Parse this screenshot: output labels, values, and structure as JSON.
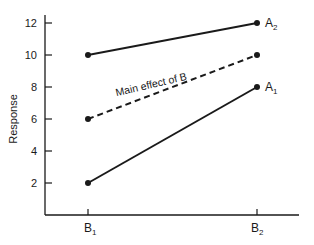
{
  "chart_data": {
    "type": "line",
    "title": "",
    "xlabel": "",
    "ylabel": "Response",
    "categories": [
      "B1",
      "B2"
    ],
    "category_labels": [
      {
        "base": "B",
        "sub": "1"
      },
      {
        "base": "B",
        "sub": "2"
      }
    ],
    "yticks": [
      2,
      4,
      6,
      8,
      10,
      12
    ],
    "ylim": [
      0,
      12.5
    ],
    "grid": false,
    "legend": "none (direct line labels)",
    "series": [
      {
        "name": "A2",
        "label_base": "A",
        "label_sub": "2",
        "values": [
          10,
          12
        ],
        "style": "solid"
      },
      {
        "name": "Main effect of B",
        "values": [
          6,
          10
        ],
        "style": "dashed"
      },
      {
        "name": "A1",
        "label_base": "A",
        "label_sub": "1",
        "values": [
          2,
          8
        ],
        "style": "solid"
      }
    ],
    "annotations": [
      {
        "text": "Main effect of B",
        "along_series": "Main effect of B"
      }
    ]
  }
}
